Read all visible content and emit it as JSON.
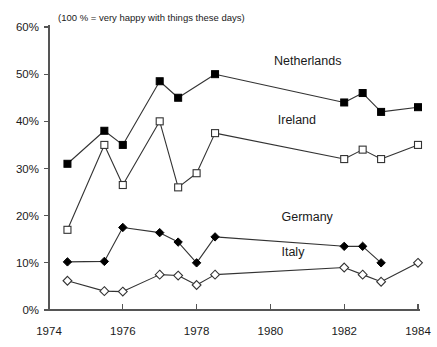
{
  "chart_data": {
    "type": "line",
    "title": "(100 % = very happy with things these days)",
    "xlabel": "",
    "ylabel": "",
    "xlim": [
      1974,
      1984
    ],
    "ylim": [
      0,
      60
    ],
    "grid": false,
    "legend_position": "inline-annotations",
    "x_ticks": [
      1974,
      1976,
      1978,
      1980,
      1982,
      1984
    ],
    "x_tick_labels": [
      "1974",
      "1976",
      "1978",
      "1980",
      "1982",
      "1984"
    ],
    "y_ticks": [
      0,
      10,
      20,
      30,
      40,
      50,
      60
    ],
    "y_tick_labels": [
      "0%",
      "10%",
      "20%",
      "30%",
      "40%",
      "50%",
      "60%"
    ],
    "series": [
      {
        "name": "Netherlands",
        "marker": "filled-square",
        "label_x": 1980.1,
        "label_y": 52.0,
        "x": [
          1974.5,
          1975.5,
          1976.0,
          1977.0,
          1977.5,
          1978.5,
          1982.0,
          1982.5,
          1983.0,
          1984.0
        ],
        "values": [
          31.0,
          38.0,
          35.0,
          48.5,
          45.0,
          50.0,
          44.0,
          46.0,
          42.0,
          43.0
        ]
      },
      {
        "name": "Ireland",
        "marker": "open-square",
        "label_x": 1980.2,
        "label_y": 39.5,
        "x": [
          1974.5,
          1975.5,
          1976.0,
          1977.0,
          1977.5,
          1978.0,
          1978.5,
          1982.0,
          1982.5,
          1983.0,
          1984.0
        ],
        "values": [
          17.0,
          35.0,
          26.5,
          40.0,
          26.0,
          29.0,
          37.5,
          32.0,
          34.0,
          32.0,
          35.0
        ]
      },
      {
        "name": "Germany",
        "marker": "filled-diamond",
        "label_x": 1980.3,
        "label_y": 18.8,
        "x": [
          1974.5,
          1975.5,
          1976.0,
          1977.0,
          1977.5,
          1978.0,
          1978.5,
          1982.0,
          1982.5,
          1983.0
        ],
        "values": [
          10.2,
          10.3,
          17.5,
          16.4,
          14.4,
          10.0,
          15.5,
          13.5,
          13.5,
          10.0
        ]
      },
      {
        "name": "Italy",
        "marker": "open-diamond",
        "label_x": 1980.3,
        "label_y": 11.5,
        "x": [
          1974.5,
          1975.5,
          1976.0,
          1977.0,
          1977.5,
          1978.0,
          1978.5,
          1982.0,
          1982.5,
          1983.0,
          1984.0
        ],
        "values": [
          6.2,
          4.0,
          3.9,
          7.5,
          7.3,
          5.3,
          7.5,
          9.0,
          7.5,
          6.0,
          10.0
        ]
      }
    ],
    "colors": {
      "line": "#333333",
      "axis": "#555555",
      "text": "#1a1a1a",
      "marker_fill": "#000000",
      "marker_open_fill": "#ffffff"
    }
  }
}
